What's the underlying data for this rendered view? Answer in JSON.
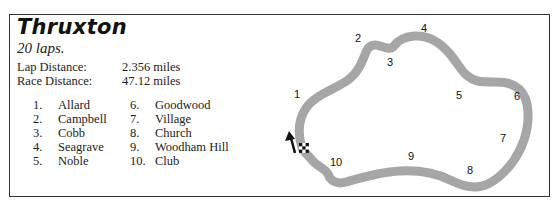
{
  "circuit": {
    "name": "Thruxton",
    "laps": "20 laps.",
    "lap_distance_label": "Lap Distance:",
    "lap_distance_value": "2.356 miles",
    "race_distance_label": "Race Distance:",
    "race_distance_value": "47.12 miles"
  },
  "corners": [
    {
      "num": "1.",
      "name": "Allard"
    },
    {
      "num": "2.",
      "name": "Campbell"
    },
    {
      "num": "3.",
      "name": "Cobb"
    },
    {
      "num": "4.",
      "name": "Seagrave"
    },
    {
      "num": "5.",
      "name": "Noble"
    },
    {
      "num": "6.",
      "name": "Goodwood"
    },
    {
      "num": "7.",
      "name": "Village"
    },
    {
      "num": "8.",
      "name": "Church"
    },
    {
      "num": "9.",
      "name": "Woodham Hill"
    },
    {
      "num": "10.",
      "name": "Club"
    }
  ],
  "map": {
    "track_color": "#a6a6a6",
    "labels": [
      "1",
      "2",
      "3",
      "4",
      "5",
      "6",
      "7",
      "8",
      "9",
      "10"
    ],
    "direction_arrow": "arrow-up-icon",
    "start_finish": "checkered-flag-icon"
  }
}
